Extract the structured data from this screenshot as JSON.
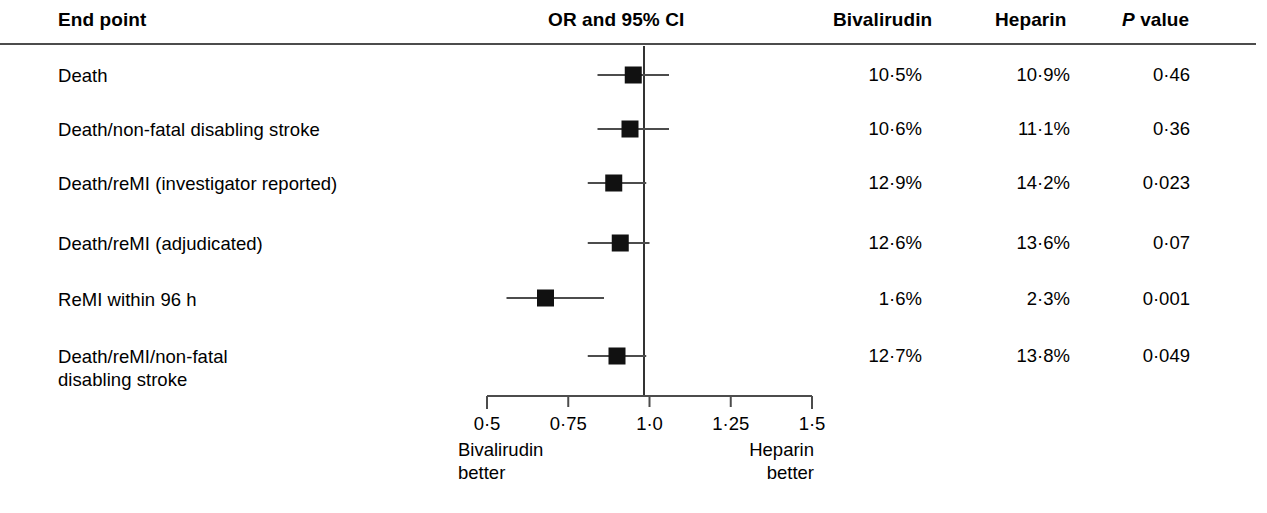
{
  "header": {
    "endpoint_label": "End point",
    "or_label": "OR and 95% CI",
    "bivalirudin_label": "Bivalirudin",
    "heparin_label": "Heparin",
    "p_italic": "P",
    "p_rest": " value"
  },
  "rows": [
    {
      "endpoint": "Death",
      "bivalirudin": "10·5%",
      "heparin": "10·9%",
      "p_value": "0·46"
    },
    {
      "endpoint": "Death/non-fatal disabling stroke",
      "bivalirudin": "10·6%",
      "heparin": "11·1%",
      "p_value": "0·36"
    },
    {
      "endpoint": "Death/reMI (investigator reported)",
      "bivalirudin": "12·9%",
      "heparin": "14·2%",
      "p_value": "0·023"
    },
    {
      "endpoint": "Death/reMI (adjudicated)",
      "bivalirudin": "12·6%",
      "heparin": "13·6%",
      "p_value": "0·07"
    },
    {
      "endpoint": "ReMI within 96 h",
      "bivalirudin": "1·6%",
      "heparin": "2·3%",
      "p_value": "0·001"
    },
    {
      "endpoint": "Death/reMI/non-fatal\ndisabling stroke",
      "bivalirudin": "12·7%",
      "heparin": "13·8%",
      "p_value": "0·049"
    }
  ],
  "axis": {
    "tick_labels": [
      "0·5",
      "0·75",
      "1·0",
      "1·25",
      "1·5"
    ],
    "tick_values": [
      0.5,
      0.75,
      1.0,
      1.25,
      1.5
    ],
    "left_footer": "Bivalirudin\nbetter",
    "right_footer": "Heparin\nbetter"
  },
  "colors": {
    "marker": "#111111",
    "line": "#4c4c4c",
    "axis": "#4c4c4c",
    "reference": "#333333",
    "background": "#ffffff"
  },
  "chart_data": {
    "type": "scatter",
    "subtype": "forest-plot",
    "title": "OR and 95% CI",
    "xlabel": "",
    "ylabel": "End point",
    "xlim": [
      0.5,
      1.5
    ],
    "xscale": "linear",
    "grid": false,
    "legend": null,
    "reference_line": 1.0,
    "xticks": [
      0.5,
      0.75,
      1.0,
      1.25,
      1.5
    ],
    "xticklabels": [
      "0·5",
      "0·75",
      "1·0",
      "1·25",
      "1·5"
    ],
    "left_annotation": "Bivalirudin better",
    "right_annotation": "Heparin better",
    "categories": [
      "Death",
      "Death/non-fatal disabling stroke",
      "Death/reMI (investigator reported)",
      "Death/reMI (adjudicated)",
      "ReMI within 96 h",
      "Death/reMI/non-fatal disabling stroke"
    ],
    "points": [
      {
        "label": "Death",
        "or": 0.95,
        "ci_low": 0.84,
        "ci_high": 1.06,
        "bivalirudin_pct": 10.5,
        "heparin_pct": 10.9,
        "p": 0.46
      },
      {
        "label": "Death/non-fatal disabling stroke",
        "or": 0.94,
        "ci_low": 0.84,
        "ci_high": 1.06,
        "bivalirudin_pct": 10.6,
        "heparin_pct": 11.1,
        "p": 0.36
      },
      {
        "label": "Death/reMI (investigator reported)",
        "or": 0.89,
        "ci_low": 0.81,
        "ci_high": 0.99,
        "bivalirudin_pct": 12.9,
        "heparin_pct": 14.2,
        "p": 0.023
      },
      {
        "label": "Death/reMI (adjudicated)",
        "or": 0.91,
        "ci_low": 0.81,
        "ci_high": 1.0,
        "bivalirudin_pct": 12.6,
        "heparin_pct": 13.6,
        "p": 0.07
      },
      {
        "label": "ReMI within 96 h",
        "or": 0.68,
        "ci_low": 0.56,
        "ci_high": 0.86,
        "bivalirudin_pct": 1.6,
        "heparin_pct": 2.3,
        "p": 0.001
      },
      {
        "label": "Death/reMI/non-fatal disabling stroke",
        "or": 0.9,
        "ci_low": 0.81,
        "ci_high": 0.99,
        "bivalirudin_pct": 12.7,
        "heparin_pct": 13.8,
        "p": 0.049
      }
    ]
  },
  "layout": {
    "row_y": [
      75,
      129,
      183,
      243,
      298,
      356
    ],
    "label_y": [
      64,
      118,
      172,
      232,
      288,
      345
    ],
    "axis_y": 396,
    "axis_left_x": 487,
    "axis_right_x": 812,
    "reference_x": 644,
    "px_per_unit": 325,
    "marker_size": 17
  }
}
